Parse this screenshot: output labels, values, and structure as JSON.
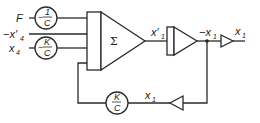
{
  "diagram": {
    "inputs": [
      {
        "label": "F",
        "sub": ""
      },
      {
        "label": "−x′",
        "sub": "4"
      },
      {
        "label": "x",
        "sub": "4"
      }
    ],
    "coefficients": {
      "input_F": {
        "sign": "−",
        "num": "1",
        "den": "C"
      },
      "input_x4": {
        "sign": "−",
        "num": "K",
        "den": "C"
      },
      "feedback": {
        "sign": "",
        "num": "K",
        "den": "C"
      }
    },
    "summer_symbol": "Σ",
    "signals": {
      "summer_out": {
        "label": "x′",
        "sub": "1"
      },
      "integrator_out": {
        "label": "−x",
        "sub": "1"
      },
      "inverter_out": {
        "label": "x",
        "sub": "1"
      },
      "feedback": {
        "label": "x",
        "sub": "1"
      }
    },
    "blocks": [
      "summer",
      "integrator",
      "inverter",
      "feedback-inverter",
      "coefficient-potentiometer"
    ]
  }
}
